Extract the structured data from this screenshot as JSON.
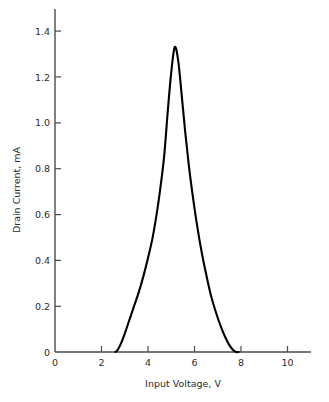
{
  "chart_data": {
    "type": "line",
    "title": "",
    "xlabel": "Input Voltage, V",
    "ylabel": "Drain Current, mA",
    "xlim": [
      0,
      11
    ],
    "ylim": [
      0,
      1.48
    ],
    "xticks": [
      0,
      2,
      4,
      6,
      8,
      10
    ],
    "xtick_labels": [
      "0",
      "2",
      "4",
      "6",
      "8",
      "10"
    ],
    "yticks": [
      0,
      0.2,
      0.4,
      0.6,
      0.8,
      1.0,
      1.2,
      1.4
    ],
    "ytick_labels": [
      "0",
      "0.2",
      "0.4",
      "0.6",
      "0.8",
      "1.0",
      "1.2",
      "1.4"
    ],
    "grid": false,
    "legend": false,
    "legend_position": "none",
    "series": [
      {
        "name": "Drain Current",
        "color": "#000000",
        "x": [
          2.6,
          2.7,
          2.85,
          3.0,
          3.2,
          3.4,
          3.6,
          3.8,
          4.0,
          4.2,
          4.4,
          4.55,
          4.7,
          4.85,
          5.0,
          5.15,
          5.3,
          5.45,
          5.6,
          5.75,
          5.9,
          6.1,
          6.3,
          6.5,
          6.7,
          6.9,
          7.1,
          7.3,
          7.5,
          7.65,
          7.78,
          7.9
        ],
        "y": [
          0.0,
          0.01,
          0.04,
          0.08,
          0.14,
          0.2,
          0.26,
          0.33,
          0.41,
          0.5,
          0.62,
          0.73,
          0.86,
          1.05,
          1.22,
          1.33,
          1.27,
          1.12,
          0.96,
          0.82,
          0.7,
          0.56,
          0.44,
          0.34,
          0.25,
          0.18,
          0.12,
          0.07,
          0.03,
          0.01,
          0.0,
          0.0
        ]
      }
    ],
    "annotations": {
      "peak_value": "1.33",
      "peak_voltage": "5.15",
      "left_foot_voltage": "2.7",
      "right_foot_voltage": "7.78"
    }
  },
  "axes": {
    "x_title": "Input Voltage, V",
    "y_title": "Drain Current, mA"
  },
  "colors": {
    "curve": "#000000",
    "axis": "#4a4a4a",
    "text": "#2b2b2b",
    "background": "#ffffff"
  }
}
